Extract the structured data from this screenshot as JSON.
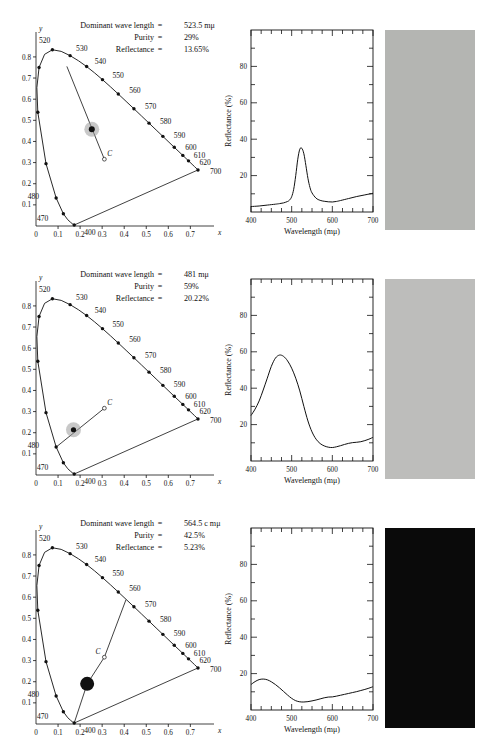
{
  "figure": {
    "panel_count": 3,
    "labels": {
      "dominant_wavelength": "Dominant wave length",
      "purity": "Purity",
      "reflectance": "Reflectance",
      "equals": "=",
      "x_axis_cie": "x",
      "y_axis_cie": "y",
      "spectrum_x_title": "Wavelength (mμ)",
      "spectrum_y_title": "Reflectance (%)",
      "white_point": "C"
    },
    "cie_wavelength_labels": [
      "400",
      "470",
      "480",
      "520",
      "530",
      "540",
      "550",
      "560",
      "570",
      "580",
      "590",
      "600",
      "610",
      "620",
      "700"
    ],
    "cie_x_ticks": [
      "0",
      "0.1",
      "0.2",
      "0.3",
      "0.4",
      "0.5",
      "0.6",
      "0.7"
    ],
    "cie_y_ticks": [
      "0.1",
      "0.2",
      "0.3",
      "0.4",
      "0.5",
      "0.6",
      "0.7",
      "0.8"
    ],
    "spectrum_x_ticks": [
      "400",
      "500",
      "600",
      "700"
    ],
    "spectrum_y_ticks": [
      "20",
      "40",
      "60",
      "80"
    ]
  },
  "panels": [
    {
      "id": "panel-green",
      "dominant_wavelength": "523.5 mμ",
      "purity": "29%",
      "reflectance": "13.65%",
      "swatch_color": "#b4b5b2",
      "sample_point": {
        "x": 0.253,
        "y": 0.458
      },
      "white_point": {
        "x": 0.31,
        "y": 0.316
      },
      "dominant_locus_point": {
        "x": 0.14,
        "y": 0.755
      },
      "sample_dot_radius": 3.0,
      "halo_radius": 7.5
    },
    {
      "id": "panel-blue",
      "dominant_wavelength": "481 mμ",
      "purity": "59%",
      "reflectance": "20.22%",
      "swatch_color": "#bdbdbb",
      "sample_point": {
        "x": 0.17,
        "y": 0.214
      },
      "white_point": {
        "x": 0.31,
        "y": 0.316
      },
      "dominant_locus_point": {
        "x": 0.0912,
        "y": 0.132
      },
      "sample_dot_radius": 2.6,
      "halo_radius": 7.5
    },
    {
      "id": "panel-purple",
      "dominant_wavelength": "564.5 c mμ",
      "purity": "42.5%",
      "reflectance": "5.23%",
      "swatch_color": "#0a0a0a",
      "sample_point": {
        "x": 0.232,
        "y": 0.19
      },
      "white_point": {
        "x": 0.31,
        "y": 0.316
      },
      "dominant_locus_point": {
        "x": 0.408,
        "y": 0.588
      },
      "sample_dot_radius": 7.0,
      "halo_radius": 0
    }
  ],
  "chart_data": [
    {
      "type": "line",
      "title": "",
      "xlabel": "Wavelength (mμ)",
      "ylabel": "Reflectance (%)",
      "xlim": [
        400,
        700
      ],
      "ylim": [
        0,
        100
      ],
      "xticks": [
        400,
        500,
        600,
        700
      ],
      "yticks": [
        20,
        40,
        60,
        80
      ],
      "grid": false,
      "series": [
        {
          "name": "Sample 1 reflectance",
          "x": [
            400,
            420,
            440,
            460,
            470,
            480,
            490,
            495,
            500,
            505,
            510,
            515,
            520,
            525,
            530,
            535,
            540,
            545,
            550,
            560,
            570,
            580,
            590,
            600,
            610,
            620,
            640,
            660,
            680,
            700
          ],
          "values": [
            3.0,
            3.3,
            3.8,
            4.3,
            4.6,
            5.0,
            5.8,
            6.6,
            8.4,
            12.5,
            20.0,
            29.0,
            34.5,
            35.0,
            32.0,
            25.5,
            18.5,
            13.5,
            10.5,
            7.6,
            6.4,
            5.9,
            5.6,
            5.5,
            5.8,
            6.3,
            7.4,
            8.5,
            9.4,
            10.3
          ]
        }
      ]
    },
    {
      "type": "line",
      "title": "",
      "xlabel": "Wavelength (mμ)",
      "ylabel": "Reflectance (%)",
      "xlim": [
        400,
        700
      ],
      "ylim": [
        0,
        100
      ],
      "xticks": [
        400,
        500,
        600,
        700
      ],
      "yticks": [
        20,
        40,
        60,
        80
      ],
      "grid": false,
      "series": [
        {
          "name": "Sample 2 reflectance",
          "x": [
            400,
            410,
            420,
            430,
            440,
            450,
            460,
            470,
            480,
            490,
            500,
            510,
            520,
            530,
            540,
            550,
            560,
            570,
            580,
            590,
            600,
            610,
            620,
            630,
            640,
            650,
            660,
            670,
            680,
            690,
            700
          ],
          "values": [
            25.0,
            28.5,
            33.0,
            39.0,
            45.5,
            52.0,
            56.5,
            58.2,
            57.5,
            55.0,
            51.0,
            45.5,
            38.5,
            30.0,
            22.0,
            16.0,
            12.0,
            9.6,
            8.3,
            7.6,
            7.4,
            7.8,
            8.4,
            9.1,
            9.7,
            10.1,
            10.3,
            10.6,
            11.2,
            12.0,
            13.0
          ]
        }
      ]
    },
    {
      "type": "line",
      "title": "",
      "xlabel": "Wavelength (mμ)",
      "ylabel": "Reflectance (%)",
      "xlim": [
        400,
        700
      ],
      "ylim": [
        0,
        100
      ],
      "xticks": [
        400,
        500,
        600,
        700
      ],
      "yticks": [
        20,
        40,
        60,
        80
      ],
      "grid": false,
      "series": [
        {
          "name": "Sample 3 reflectance",
          "x": [
            400,
            410,
            420,
            430,
            440,
            450,
            460,
            470,
            480,
            490,
            500,
            510,
            520,
            530,
            540,
            550,
            560,
            570,
            580,
            590,
            600,
            610,
            620,
            630,
            640,
            650,
            660,
            670,
            680,
            690,
            700
          ],
          "values": [
            14.0,
            15.6,
            16.7,
            17.0,
            16.6,
            15.5,
            14.0,
            12.2,
            10.2,
            8.2,
            6.4,
            5.1,
            4.5,
            4.4,
            4.6,
            5.0,
            5.5,
            6.1,
            6.7,
            7.1,
            7.2,
            7.6,
            8.1,
            8.6,
            9.1,
            9.6,
            10.1,
            10.7,
            11.3,
            12.0,
            12.8
          ]
        }
      ]
    }
  ]
}
